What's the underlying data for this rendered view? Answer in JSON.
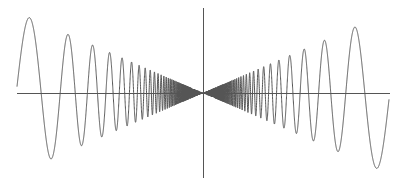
{
  "chart_data": {
    "type": "line",
    "title": "",
    "xlabel": "",
    "ylabel": "",
    "function": "f(x) = x * cos(a / x), odd-symmetric oscillation with frequency increasing toward the origin",
    "params": {
      "a": 20.5,
      "amplitude_scale": 0.95
    },
    "xlim": [
      -1,
      1
    ],
    "ylim": [
      -1,
      1
    ],
    "grid": false,
    "legend": null,
    "axes": {
      "x_axis_y": 0,
      "y_axis_x": 0,
      "tick_labels": false
    },
    "series": [
      {
        "name": "curve",
        "color": "#555555"
      }
    ],
    "layout_px": {
      "origin_x": 203,
      "origin_y": 93,
      "x_half_width": 186,
      "y_half_height": 85,
      "xaxis_left": 17,
      "xaxis_right": 390,
      "yaxis_top": 8,
      "yaxis_bottom": 178
    },
    "colors": {
      "axes": "#555555",
      "curve": "#555555",
      "background": "#ffffff"
    }
  }
}
